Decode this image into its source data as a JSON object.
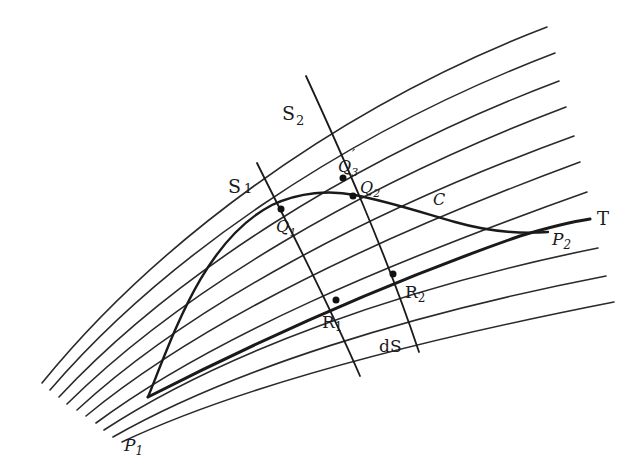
{
  "diagram": {
    "labels": {
      "s1": "S",
      "s1_sub": "1",
      "s2": "S",
      "s2_sub": "2",
      "q1": "Q",
      "q1_sub": "1",
      "q2": "Q",
      "q2_sub": "2",
      "q3p": "Q",
      "q3p_sub": "3",
      "q3p_prime": "′",
      "c": "C",
      "t": "T",
      "p1": "P",
      "p1_sub": "1",
      "p2": "P",
      "p2_sub": "2",
      "r1": "R",
      "r1_sub": "1",
      "r2": "R",
      "r2_sub": "2",
      "ds": "dS"
    },
    "points": [
      "P1",
      "P2",
      "Q1",
      "Q2",
      "Q3'",
      "R1",
      "R2"
    ],
    "curves": [
      "family (10 curves)",
      "C",
      "T",
      "S1",
      "S2"
    ]
  }
}
